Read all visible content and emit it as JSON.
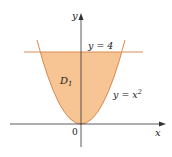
{
  "figure": {
    "region_label": "D",
    "region_subscript": "1",
    "line_label": "y = 4",
    "curve_label_base": "y = x",
    "curve_label_exp": "2",
    "origin_label": "0",
    "x_axis_label": "x",
    "y_axis_label": "y",
    "colors": {
      "fill": "#f5c28f",
      "curve": "#d9814a",
      "axis": "#333333"
    }
  }
}
